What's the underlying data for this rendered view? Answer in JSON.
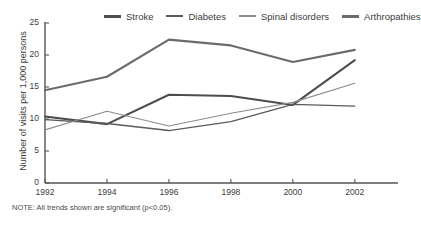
{
  "chart_data": {
    "type": "line",
    "title": "",
    "subtitle": "",
    "xlabel": "",
    "ylabel": "Number of visits per 1,000 persons",
    "x": [
      1992,
      1994,
      1996,
      1998,
      2000,
      2002
    ],
    "xticklabels": [
      "1992",
      "1994",
      "1996",
      "1998",
      "2000",
      "2002"
    ],
    "yticklabels": [
      "0",
      "5",
      "10",
      "15",
      "20",
      "25"
    ],
    "yticks": [
      0,
      5,
      10,
      15,
      20,
      25
    ],
    "xlim": [
      1992,
      2003.2
    ],
    "ylim": [
      0,
      25
    ],
    "grid": false,
    "legend_position": "top",
    "note": "NOTE: All trends shown are significant (p<0.05).",
    "series": [
      {
        "name": "Stroke",
        "color": "#4d4d4d",
        "width": 2.1,
        "values": [
          10.4,
          9.2,
          13.8,
          13.6,
          12.2,
          19.2
        ]
      },
      {
        "name": "Diabetes",
        "color": "#5a5a5a",
        "width": 1.3,
        "values": [
          9.9,
          9.3,
          8.2,
          9.6,
          12.3,
          12.0
        ]
      },
      {
        "name": "Spinal disorders",
        "color": "#8c8c8c",
        "width": 1.1,
        "values": [
          8.3,
          11.2,
          8.9,
          10.9,
          12.6,
          15.6
        ]
      },
      {
        "name": "Arthropathies",
        "color": "#6b6b6b",
        "width": 2.1,
        "values": [
          14.5,
          16.6,
          22.4,
          21.5,
          18.9,
          20.8
        ]
      }
    ]
  },
  "axis": {
    "color": "#555555"
  }
}
